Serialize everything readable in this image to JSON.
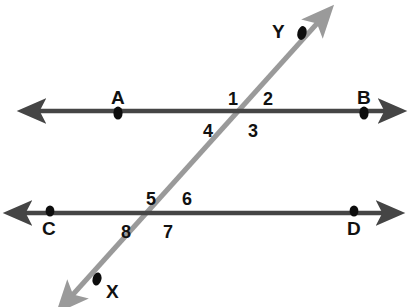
{
  "figure": {
    "colors": {
      "parallel_line": "#454545",
      "transversal": "#9a9a9a",
      "point_dot": "#0d0d0d",
      "label_text": "#111111",
      "background": "#ffffff"
    },
    "lines": [
      {
        "name": "line-ab",
        "kind": "parallel-line",
        "orientation": "horizontal",
        "endpoints_label": [
          "A",
          "B"
        ],
        "y": 111,
        "x_start": 32,
        "x_end": 392,
        "double_arrow": true
      },
      {
        "name": "line-cd",
        "kind": "parallel-line",
        "orientation": "horizontal",
        "endpoints_label": [
          "C",
          "D"
        ],
        "y": 213,
        "x_start": 18,
        "x_end": 390,
        "double_arrow": true
      },
      {
        "name": "line-xy",
        "kind": "transversal",
        "orientation": "diagonal",
        "endpoints_label": [
          "X",
          "Y"
        ],
        "x_start": 68,
        "y_start": 300,
        "x_end": 322,
        "y_end": 18,
        "double_arrow": true
      }
    ],
    "intersections": [
      {
        "name": "upper-intersection",
        "x": 237,
        "y": 111,
        "lines": [
          "line-ab",
          "line-xy"
        ]
      },
      {
        "name": "lower-intersection",
        "x": 157,
        "y": 213,
        "lines": [
          "line-cd",
          "line-xy"
        ]
      }
    ],
    "points": [
      {
        "label": "A",
        "dot_x": 118,
        "dot_y": 113,
        "label_x": 111,
        "label_y": 88,
        "on": "line-ab"
      },
      {
        "label": "B",
        "dot_x": 364,
        "dot_y": 113,
        "label_x": 357,
        "label_y": 88,
        "on": "line-ab"
      },
      {
        "label": "C",
        "dot_x": 50,
        "dot_y": 211,
        "label_x": 42,
        "label_y": 219,
        "on": "line-cd"
      },
      {
        "label": "D",
        "dot_x": 354,
        "dot_y": 211,
        "label_x": 347,
        "label_y": 219,
        "on": "line-cd"
      },
      {
        "label": "Y",
        "dot_x": 302,
        "dot_y": 33,
        "label_x": 272,
        "label_y": 22,
        "on": "line-xy"
      },
      {
        "label": "X",
        "dot_x": 97,
        "dot_y": 279,
        "label_x": 106,
        "label_y": 282,
        "on": "line-xy"
      }
    ],
    "angle_labels": [
      {
        "label": "1",
        "x": 228,
        "y": 90,
        "position": "upper-left-above",
        "intersection": "upper-intersection"
      },
      {
        "label": "2",
        "x": 263,
        "y": 90,
        "position": "upper-right-above",
        "intersection": "upper-intersection"
      },
      {
        "label": "3",
        "x": 248,
        "y": 122,
        "position": "lower-right-below",
        "intersection": "upper-intersection"
      },
      {
        "label": "4",
        "x": 203,
        "y": 122,
        "position": "lower-left-below",
        "intersection": "upper-intersection"
      },
      {
        "label": "5",
        "x": 146,
        "y": 190,
        "position": "upper-left-above",
        "intersection": "lower-intersection"
      },
      {
        "label": "6",
        "x": 182,
        "y": 190,
        "position": "upper-right-above",
        "intersection": "lower-intersection"
      },
      {
        "label": "7",
        "x": 163,
        "y": 223,
        "position": "lower-right-below",
        "intersection": "lower-intersection"
      },
      {
        "label": "8",
        "x": 121,
        "y": 223,
        "position": "lower-left-below",
        "intersection": "lower-intersection"
      }
    ]
  }
}
